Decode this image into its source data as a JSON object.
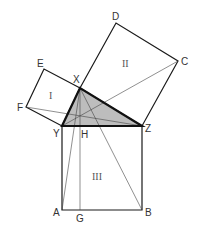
{
  "diagram": {
    "title": "",
    "colors": {
      "line": "#1a1a1a",
      "thin_line": "#444444",
      "triangle_fill": "#bdbdbd",
      "background": "#ffffff"
    },
    "points": {
      "X": [
        80,
        88
      ],
      "Y": [
        62,
        126
      ],
      "Z": [
        142,
        126
      ],
      "A": [
        62,
        210
      ],
      "B": [
        142,
        210
      ],
      "G": [
        80,
        210
      ],
      "H": [
        80,
        126
      ],
      "C": [
        178,
        61
      ],
      "D": [
        116,
        23
      ],
      "E": [
        44,
        69
      ],
      "F": [
        26,
        107
      ]
    },
    "labels": {
      "X": "X",
      "Y": "Y",
      "Z": "Z",
      "A": "A",
      "B": "B",
      "G": "G",
      "H": "H",
      "C": "C",
      "D": "D",
      "E": "E",
      "F": "F"
    },
    "region_labels": {
      "square_I": "I",
      "square_II": "II",
      "square_III": "III"
    },
    "squares": [
      {
        "name": "I",
        "vertices": [
          "Y",
          "X",
          "E",
          "F"
        ]
      },
      {
        "name": "II",
        "vertices": [
          "X",
          "D",
          "C",
          "Z"
        ]
      },
      {
        "name": "III",
        "vertices": [
          "Y",
          "Z",
          "B",
          "A"
        ]
      }
    ],
    "triangle": {
      "vertices": [
        "X",
        "Y",
        "Z"
      ],
      "shaded": true
    },
    "construction_lines": [
      [
        "F",
        "Z"
      ],
      [
        "Y",
        "C"
      ],
      [
        "X",
        "A"
      ],
      [
        "X",
        "B"
      ],
      [
        "X",
        "G"
      ]
    ]
  }
}
